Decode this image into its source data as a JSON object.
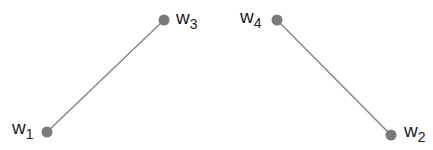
{
  "diagram": {
    "colors": {
      "node": "#7a7a7a",
      "edge": "#8a8a8a",
      "label": "#222222"
    },
    "nodes": [
      {
        "id": "w1",
        "var": "w",
        "sub": "1",
        "x": 47,
        "y": 132
      },
      {
        "id": "w2",
        "var": "w",
        "sub": "2",
        "x": 391,
        "y": 135
      },
      {
        "id": "w3",
        "var": "w",
        "sub": "3",
        "x": 164,
        "y": 20
      },
      {
        "id": "w4",
        "var": "w",
        "sub": "4",
        "x": 277,
        "y": 20
      }
    ],
    "edges": [
      {
        "from": "w1",
        "to": "w3"
      },
      {
        "from": "w4",
        "to": "w2"
      }
    ]
  }
}
